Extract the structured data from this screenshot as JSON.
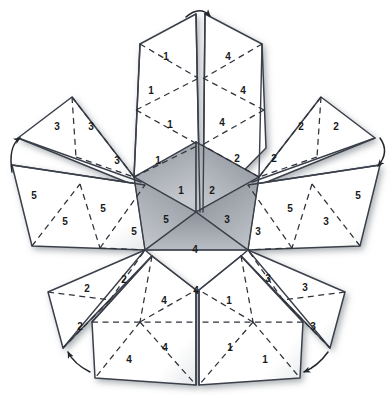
{
  "figure": {
    "type": "geometric-net",
    "background_color": "#ffffff",
    "line_color": "#3a3f4a",
    "dash_color": "#2e323b",
    "shade_color": "#9a9ea6",
    "label_color": "#1a1a1a"
  },
  "legend": {
    "solid_line_meaning": "cut edge",
    "dashed_line_meaning": "fold edge",
    "arrow_meaning": "edges to be joined"
  },
  "face_numbers": [
    "1",
    "2",
    "3",
    "4",
    "5"
  ],
  "labels": [
    {
      "id": "t1",
      "text": "1",
      "x": 166,
      "y": 57
    },
    {
      "id": "t2",
      "text": "4",
      "x": 228,
      "y": 57
    },
    {
      "id": "t3",
      "text": "1",
      "x": 151,
      "y": 91
    },
    {
      "id": "t4",
      "text": "4",
      "x": 243,
      "y": 91
    },
    {
      "id": "t5",
      "text": "3",
      "x": 57,
      "y": 127
    },
    {
      "id": "t6",
      "text": "3",
      "x": 91,
      "y": 127
    },
    {
      "id": "t7",
      "text": "1",
      "x": 170,
      "y": 125
    },
    {
      "id": "t8",
      "text": "4",
      "x": 222,
      "y": 123
    },
    {
      "id": "t9",
      "text": "2",
      "x": 301,
      "y": 127
    },
    {
      "id": "t10",
      "text": "2",
      "x": 336,
      "y": 127
    },
    {
      "id": "t11",
      "text": "3",
      "x": 117,
      "y": 161
    },
    {
      "id": "t12",
      "text": "1",
      "x": 158,
      "y": 161
    },
    {
      "id": "t13",
      "text": "2",
      "x": 237,
      "y": 159
    },
    {
      "id": "t14",
      "text": "2",
      "x": 274,
      "y": 159
    },
    {
      "id": "t15",
      "text": "1",
      "x": 181,
      "y": 191
    },
    {
      "id": "t16",
      "text": "2",
      "x": 212,
      "y": 191
    },
    {
      "id": "t17",
      "text": "5",
      "x": 34,
      "y": 196
    },
    {
      "id": "t18",
      "text": "5",
      "x": 103,
      "y": 209
    },
    {
      "id": "t19",
      "text": "5",
      "x": 290,
      "y": 209
    },
    {
      "id": "t20",
      "text": "5",
      "x": 358,
      "y": 196
    },
    {
      "id": "t21",
      "text": "5",
      "x": 65,
      "y": 222
    },
    {
      "id": "t22",
      "text": "5",
      "x": 166,
      "y": 220
    },
    {
      "id": "t23",
      "text": "3",
      "x": 227,
      "y": 220
    },
    {
      "id": "t24",
      "text": "3",
      "x": 326,
      "y": 222
    },
    {
      "id": "t25",
      "text": "5",
      "x": 134,
      "y": 232
    },
    {
      "id": "t26",
      "text": "3",
      "x": 258,
      "y": 232
    },
    {
      "id": "t27",
      "text": "4",
      "x": 195,
      "y": 250
    },
    {
      "id": "t28",
      "text": "2",
      "x": 124,
      "y": 280
    },
    {
      "id": "t29",
      "text": "3",
      "x": 268,
      "y": 279
    },
    {
      "id": "t30",
      "text": "2",
      "x": 87,
      "y": 289
    },
    {
      "id": "t31",
      "text": "3",
      "x": 305,
      "y": 288
    },
    {
      "id": "t32",
      "text": "4",
      "x": 196,
      "y": 291
    },
    {
      "id": "t33",
      "text": "4",
      "x": 164,
      "y": 301
    },
    {
      "id": "t34",
      "text": "1",
      "x": 229,
      "y": 301
    },
    {
      "id": "t35",
      "text": "2",
      "x": 80,
      "y": 327
    },
    {
      "id": "t36",
      "text": "3",
      "x": 313,
      "y": 327
    },
    {
      "id": "t37",
      "text": "4",
      "x": 165,
      "y": 348
    },
    {
      "id": "t38",
      "text": "1",
      "x": 230,
      "y": 348
    },
    {
      "id": "t39",
      "text": "4",
      "x": 129,
      "y": 360
    },
    {
      "id": "t40",
      "text": "1",
      "x": 265,
      "y": 360
    }
  ],
  "arrows": [
    {
      "id": "arrow-top",
      "position": "top",
      "direction": "clockwise"
    },
    {
      "id": "arrow-left",
      "position": "left",
      "direction": "up"
    },
    {
      "id": "arrow-right",
      "position": "right",
      "direction": "down"
    },
    {
      "id": "arrow-bottom-left",
      "position": "bottom-left",
      "direction": "up-left"
    },
    {
      "id": "arrow-bottom-right",
      "position": "bottom-right",
      "direction": "down-left"
    }
  ]
}
